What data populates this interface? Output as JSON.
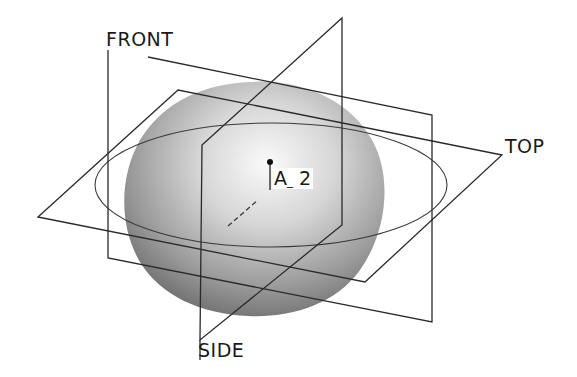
{
  "diagram": {
    "planes": [
      {
        "name": "FRONT",
        "label": "FRONT"
      },
      {
        "name": "TOP",
        "label": "TOP"
      },
      {
        "name": "SIDE",
        "label": "SIDE"
      }
    ],
    "axis": {
      "label": "A_2",
      "label_main": "A",
      "label_sub": "_",
      "label_num": "2"
    },
    "colors": {
      "line": "#2a2a2a",
      "shape_light": "#f2f2f2",
      "shape_mid": "#b5b5b5",
      "shape_dark": "#6e6e6e",
      "background": "#ffffff"
    }
  }
}
